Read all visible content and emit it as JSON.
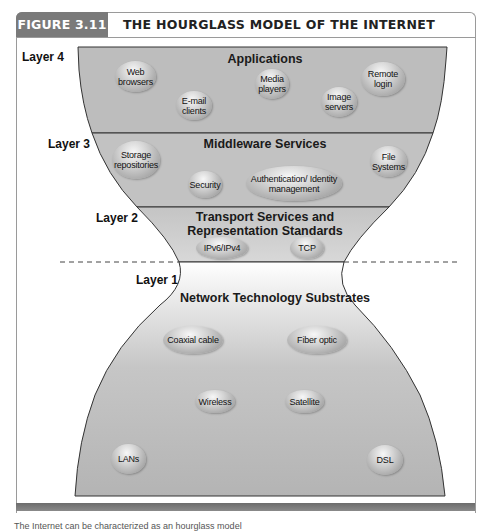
{
  "figure": {
    "tag": "FIGURE 3.11",
    "title": "THE HOURGLASS MODEL OF THE INTERNET"
  },
  "layers": [
    {
      "label": "Layer 4",
      "title": "Applications",
      "items": [
        "Web browsers",
        "E-mail clients",
        "Media players",
        "Image servers",
        "Remote login"
      ]
    },
    {
      "label": "Layer 3",
      "title": "Middleware Services",
      "items": [
        "Storage repositories",
        "Security",
        "Authentication/ Identity management",
        "File Systems"
      ]
    },
    {
      "label": "Layer 2",
      "title_line1": "Transport Services and",
      "title_line2": "Representation Standards",
      "items": [
        "IPv6/IPv4",
        "TCP"
      ]
    },
    {
      "label": "Layer 1",
      "title": "Network Technology Substrates",
      "items": [
        "Coaxial cable",
        "Fiber optic",
        "Wireless",
        "Satellite",
        "LANs",
        "DSL"
      ]
    }
  ],
  "colors": {
    "band_fill": "#bdbdbd",
    "tag_fill": "#7a7a7a",
    "outline": "#333333"
  },
  "caption": "The Internet can be characterized as an hourglass model"
}
